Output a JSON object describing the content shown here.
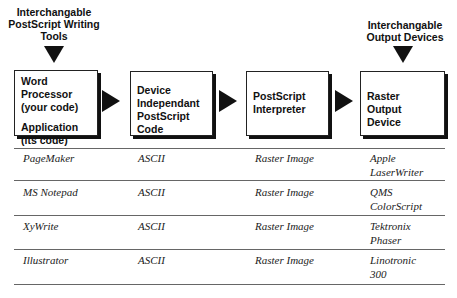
{
  "diagram": {
    "top_labels": {
      "writing_tools": [
        "Interchangable",
        "PostScript Writing",
        "Tools"
      ],
      "output_devices": [
        "Interchangable",
        "Output Devices"
      ]
    },
    "boxes": [
      {
        "lines": [
          "Word Processor",
          "(your code)",
          "",
          "Application",
          "(its code)"
        ]
      },
      {
        "lines": [
          "Device",
          "Independant",
          "PostScript Code"
        ]
      },
      {
        "lines": [
          "PostScript",
          "Interpreter"
        ]
      },
      {
        "lines": [
          "Raster",
          "Output Device"
        ]
      }
    ],
    "flow_arrows": [
      "arrow-right",
      "arrow-right",
      "arrow-right"
    ],
    "input_arrows": [
      "arrow-down",
      "arrow-down"
    ]
  },
  "table": {
    "rows": [
      {
        "tool": "PageMaker",
        "code": "ASCII",
        "output": "Raster Image",
        "device": [
          "Apple",
          "LaserWriter"
        ]
      },
      {
        "tool": "MS Notepad",
        "code": "ASCII",
        "output": "Raster Image",
        "device": [
          "QMS",
          "ColorScript"
        ]
      },
      {
        "tool": "XyWrite",
        "code": "ASCII",
        "output": "Raster Image",
        "device": [
          "Tektronix",
          "Phaser"
        ]
      },
      {
        "tool": "Illustrator",
        "code": "ASCII",
        "output": "Raster Image",
        "device": [
          "Linotronic",
          "300"
        ]
      }
    ]
  }
}
